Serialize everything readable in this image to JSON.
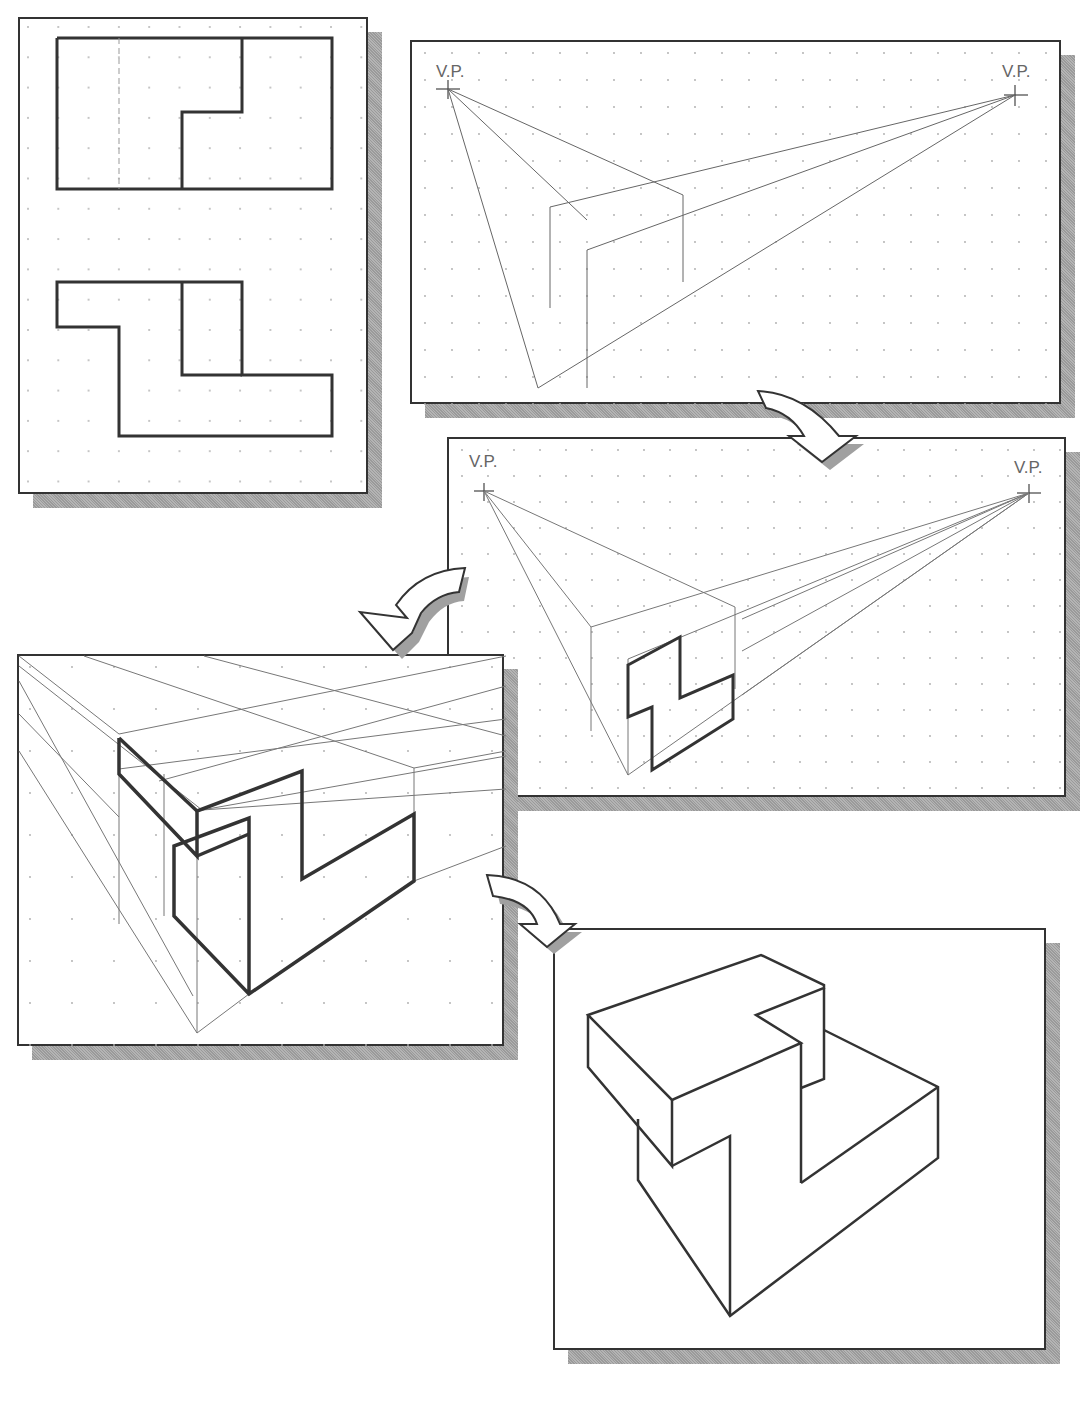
{
  "figure": {
    "colors": {
      "background": "#ffffff",
      "frame_border": "#333333",
      "shadow": "#a8a8a8",
      "construction_line": "#777777",
      "object_line": "#333333",
      "grid_dot": "#aaaaaa",
      "label": "#666666"
    }
  },
  "panels": [
    {
      "id": "orthographic-views",
      "step": 1,
      "content": "Top view and front view of Z-shaped block on dot grid"
    },
    {
      "id": "perspective-box",
      "step": 2,
      "content": "Two vanishing points with bounding box projected",
      "labels": {
        "left_vp": "V.P.",
        "right_vp": "V.P."
      }
    },
    {
      "id": "front-face-projection",
      "step": 3,
      "content": "Front Z profile drawn on box face with lines to right V.P.",
      "labels": {
        "left_vp": "V.P.",
        "right_vp": "V.P."
      }
    },
    {
      "id": "enlarged-construction",
      "step": 4,
      "content": "Enlarged view of construction with depth lines"
    },
    {
      "id": "final-perspective",
      "step": 5,
      "content": "Completed two-point perspective of object"
    }
  ],
  "arrows": [
    {
      "id": "arrow-2-to-3",
      "from": "perspective-box",
      "to": "front-face-projection"
    },
    {
      "id": "arrow-3-to-4",
      "from": "front-face-projection",
      "to": "enlarged-construction"
    },
    {
      "id": "arrow-4-to-5",
      "from": "enlarged-construction",
      "to": "final-perspective"
    }
  ]
}
